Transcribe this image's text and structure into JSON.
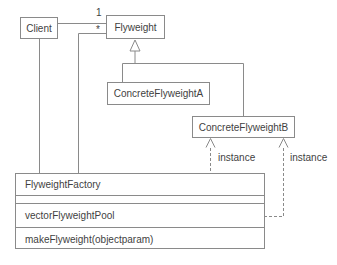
{
  "diagram": {
    "type": "uml-class-diagram",
    "background": "#ffffff",
    "line_color": "#8a8a8a",
    "text_color": "#3f3f3f",
    "classes": {
      "client": {
        "name": "Client"
      },
      "flyweight": {
        "name": "Flyweight"
      },
      "concrete_a": {
        "name": "ConcreteFlyweightA"
      },
      "concrete_b": {
        "name": "ConcreteFlyweightB"
      },
      "factory": {
        "name": "FlyweightFactory",
        "attribute": "vectorFlyweightPool",
        "operation": "makeFlyweight(objectparam)"
      }
    },
    "labels": {
      "multiplicity_one": "1",
      "multiplicity_many": "*",
      "instance_left": "instance",
      "instance_right": "instance"
    },
    "relationships": [
      "Client — Flyweight (multiplicity 1)",
      "FlyweightFactory — Flyweight (multiplicity *)",
      "Client — FlyweightFactory",
      "ConcreteFlyweightA --|> Flyweight",
      "ConcreteFlyweightB --|> Flyweight",
      "FlyweightFactory ..> ConcreteFlyweightB (instance)",
      "FlyweightFactory ..> ConcreteFlyweightB (instance)"
    ]
  }
}
